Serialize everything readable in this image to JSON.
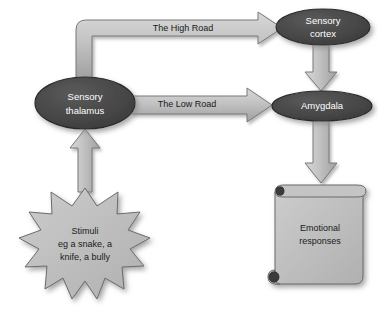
{
  "diagram": {
    "background_color": "#ffffff",
    "node_fill": "#4a4a4a",
    "node_stroke": "#2b2b2b",
    "node_text_color": "#ffffff",
    "arrow_fill": "#b9b9b9",
    "arrow_stroke": "#6e6e6e",
    "shape_fill": "#bcbcbc",
    "shape_stroke": "#6b6b6b",
    "label_text_color": "#1a1a1a"
  },
  "nodes": {
    "sensory_thalamus": {
      "label_line1": "Sensory",
      "label_line2": "thalamus",
      "shape": "ellipse",
      "cx": 85,
      "cy": 103,
      "rx": 50,
      "ry": 26
    },
    "sensory_cortex": {
      "label_line1": "Sensory",
      "label_line2": "cortex",
      "shape": "ellipse",
      "cx": 323,
      "cy": 27,
      "rx": 47,
      "ry": 18
    },
    "amygdala": {
      "label_line1": "Amygdala",
      "shape": "ellipse",
      "cx": 322,
      "cy": 106,
      "rx": 50,
      "ry": 15
    }
  },
  "shapes": {
    "stimuli_burst": {
      "shape": "starburst",
      "points": 12,
      "cx": 85,
      "cy": 245,
      "label_line1": "Stimuli",
      "label_line2": "eg a snake, a",
      "label_line3": "knife, a bully"
    },
    "emotional_scroll": {
      "shape": "scroll",
      "label_line1": "Emotional",
      "label_line2": "responses"
    }
  },
  "arrows": {
    "high_road": {
      "label": "The High Road",
      "from": "sensory_thalamus",
      "to": "sensory_cortex",
      "style": "elbow"
    },
    "low_road": {
      "label": "The Low Road",
      "from": "sensory_thalamus",
      "to": "amygdala",
      "style": "straight-right"
    },
    "cortex_to_amygdala": {
      "label": "",
      "from": "sensory_cortex",
      "to": "amygdala",
      "style": "down"
    },
    "amygdala_to_responses": {
      "label": "",
      "from": "amygdala",
      "to": "emotional_scroll",
      "style": "down"
    },
    "stimuli_to_thalamus": {
      "label": "",
      "from": "stimuli_burst",
      "to": "sensory_thalamus",
      "style": "up"
    }
  }
}
